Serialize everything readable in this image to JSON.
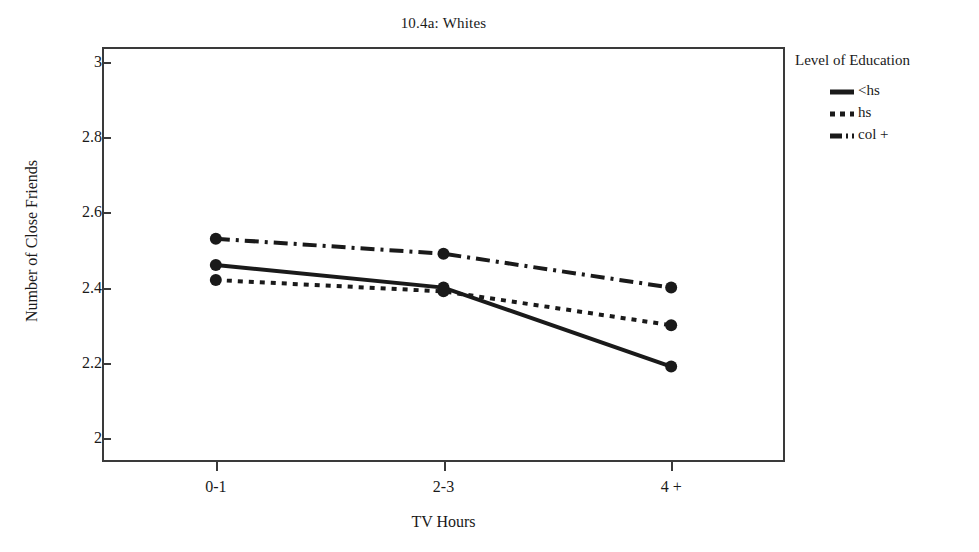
{
  "chart_data": {
    "type": "line",
    "title": "10.4a: Whites",
    "xlabel": "TV Hours",
    "ylabel": "Number of Close Friends",
    "categories": [
      "0-1",
      "2-3",
      "4 +"
    ],
    "ylim": [
      2,
      3
    ],
    "yticks": [
      "2",
      "2.2",
      "2.4",
      "2.6",
      "2.8",
      "3"
    ],
    "ytick_values": [
      2,
      2.2,
      2.4,
      2.6,
      2.8,
      3
    ],
    "grid": false,
    "legend_position": "right",
    "legend_title": "Level of Education",
    "series": [
      {
        "name": "<hs",
        "style": "solid",
        "marker": "circle",
        "values": [
          2.46,
          2.4,
          2.19
        ]
      },
      {
        "name": "hs",
        "style": "dotted",
        "marker": "circle",
        "values": [
          2.42,
          2.39,
          2.3
        ]
      },
      {
        "name": "col +",
        "style": "dash-dot",
        "marker": "circle",
        "values": [
          2.53,
          2.49,
          2.4
        ]
      }
    ],
    "colors": {
      "line": "#1a1a1a",
      "axis": "#3a3a3a",
      "background": "#ffffff"
    }
  }
}
